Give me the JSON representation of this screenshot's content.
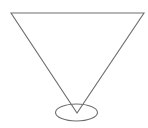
{
  "canvas": {
    "width": 148,
    "height": 128,
    "background": "#ffffff"
  },
  "style": {
    "stroke": "#6e6e6e",
    "stroke_width": 1.1
  },
  "shapes": {
    "triangle": {
      "type": "inverted-triangle",
      "points": [
        [
          11,
          13
        ],
        [
          144,
          13
        ],
        [
          77,
          113
        ]
      ]
    },
    "ellipse": {
      "type": "ellipse",
      "cx": 76.5,
      "cy": 112.5,
      "rx": 21,
      "ry": 8.5
    }
  }
}
